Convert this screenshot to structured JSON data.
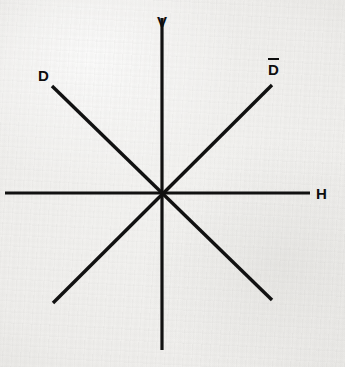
{
  "figure": {
    "background_color": "#f1f0ee",
    "line_color": "#111111",
    "label_color": "#0d0d0d",
    "width": 345,
    "height": 367,
    "center": {
      "x": 162,
      "y": 193
    }
  },
  "labels": {
    "vertical": "V",
    "horizontal": "H",
    "diagonal": "D",
    "antidiagonal": "D",
    "antidiagonal_has_overbar": true
  },
  "chart_data": {
    "type": "line",
    "xlabel": "",
    "ylabel": "",
    "grid": false,
    "legend": "none",
    "axis_origin": {
      "x": 162,
      "y": 193
    },
    "series": [
      {
        "name": "V",
        "label": "V",
        "label_position": {
          "x": 157,
          "y": 14
        },
        "angle_deg": 90,
        "x": [
          162,
          162
        ],
        "y": [
          18,
          350
        ]
      },
      {
        "name": "H",
        "label": "H",
        "label_position": {
          "x": 316,
          "y": 186
        },
        "angle_deg": 0,
        "x": [
          5,
          310
        ],
        "y": [
          193,
          193
        ]
      },
      {
        "name": "D",
        "label": "D",
        "label_position": {
          "x": 38,
          "y": 68
        },
        "angle_deg": 135,
        "x": [
          52,
          272
        ],
        "y": [
          86,
          300
        ]
      },
      {
        "name": "Dbar",
        "label": "D",
        "label_position": {
          "x": 268,
          "y": 62
        },
        "angle_deg": 45,
        "x": [
          53,
          272
        ],
        "y": [
          303,
          85
        ]
      }
    ]
  }
}
